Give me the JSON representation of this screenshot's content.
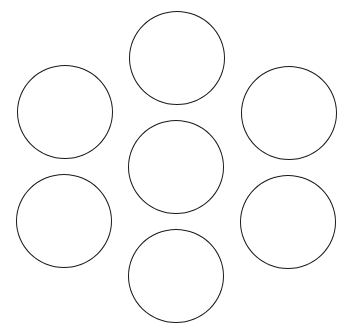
{
  "diagram": {
    "background": "#ffffff",
    "stroke_color": "#1a1a1a",
    "circles": [
      {
        "id": "top",
        "cx": 177,
        "cy": 58,
        "rx": 48,
        "ry": 47
      },
      {
        "id": "upper-left",
        "cx": 65,
        "cy": 112,
        "rx": 48,
        "ry": 47
      },
      {
        "id": "upper-right",
        "cx": 289,
        "cy": 113,
        "rx": 48,
        "ry": 47
      },
      {
        "id": "center",
        "cx": 176,
        "cy": 167,
        "rx": 48,
        "ry": 47
      },
      {
        "id": "lower-left",
        "cx": 64,
        "cy": 221,
        "rx": 48,
        "ry": 47
      },
      {
        "id": "lower-right",
        "cx": 288,
        "cy": 222,
        "rx": 48,
        "ry": 47
      },
      {
        "id": "bottom",
        "cx": 176,
        "cy": 276,
        "rx": 48,
        "ry": 47
      }
    ]
  }
}
